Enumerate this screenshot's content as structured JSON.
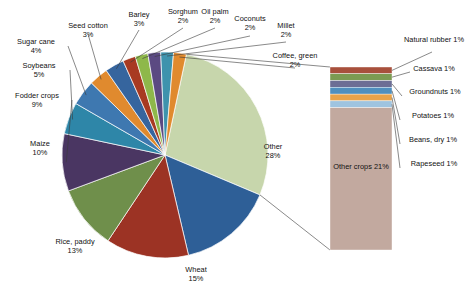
{
  "chart_data": {
    "type": "pie",
    "title": "",
    "subtitle": "",
    "xlabel": "",
    "ylabel": "",
    "legend_position": "none",
    "grid": false,
    "value_suffix": "%",
    "categories": [
      "Other",
      "Wheat",
      "Rice, paddy",
      "Maize",
      "Fodder crops",
      "Soybeans",
      "Sugar cane",
      "Seed cotton",
      "Barley",
      "Sorghum",
      "Oil palm",
      "Coconuts",
      "Millet",
      "Coffee, green"
    ],
    "values": [
      28,
      15,
      13,
      10,
      9,
      5,
      4,
      3,
      3,
      2,
      2,
      2,
      2,
      2
    ],
    "slices": [
      {
        "label": "Other",
        "value": 28,
        "value_text": "28%",
        "color": "#c7d6ac"
      },
      {
        "label": "Wheat",
        "value": 15,
        "value_text": "15%",
        "color": "#2e5f97"
      },
      {
        "label": "Rice, paddy",
        "value": 13,
        "value_text": "13%",
        "color": "#9c3324"
      },
      {
        "label": "Maize",
        "value": 10,
        "value_text": "10%",
        "color": "#6f8f4b"
      },
      {
        "label": "Fodder crops",
        "value": 9,
        "value_text": "9%",
        "color": "#4a3662"
      },
      {
        "label": "Soybeans",
        "value": 5,
        "value_text": "5%",
        "color": "#2e86a8"
      },
      {
        "label": "Sugar cane",
        "value": 4,
        "value_text": "4%",
        "color": "#3e78b0"
      },
      {
        "label": "Seed cotton",
        "value": 3,
        "value_text": "3%",
        "color": "#e08a2e"
      },
      {
        "label": "Barley",
        "value": 3,
        "value_text": "3%",
        "color": "#36659e"
      },
      {
        "label": "Sorghum",
        "value": 2,
        "value_text": "2%",
        "color": "#a83a22"
      },
      {
        "label": "Oil palm",
        "value": 2,
        "value_text": "2%",
        "color": "#8eb84a"
      },
      {
        "label": "Coconuts",
        "value": 2,
        "value_text": "2%",
        "color": "#5b4a82"
      },
      {
        "label": "Millet",
        "value": 2,
        "value_text": "2%",
        "color": "#3e93ad"
      },
      {
        "label": "Coffee, green",
        "value": 2,
        "value_text": "2%",
        "color": "#e08a2e"
      }
    ],
    "breakout": {
      "source_slice": "Other",
      "source_value": 28,
      "type": "stacked_bar",
      "segments": [
        {
          "label": "Natural rubber",
          "value": 1,
          "value_text": "1%",
          "color": "#a8503c"
        },
        {
          "label": "Cassava",
          "value": 1,
          "value_text": "1%",
          "color": "#7c9b52"
        },
        {
          "label": "Groundnuts",
          "value": 1,
          "value_text": "1%",
          "color": "#6c6e95"
        },
        {
          "label": "Potatoes",
          "value": 1,
          "value_text": "1%",
          "color": "#4f8fbe"
        },
        {
          "label": "Beans, dry",
          "value": 1,
          "value_text": "1%",
          "color": "#e8a34a"
        },
        {
          "label": "Rapeseed",
          "value": 1,
          "value_text": "1%",
          "color": "#9fc4e0"
        },
        {
          "label": "Other crops",
          "value": 21,
          "value_text": "21%",
          "color": "#c2a99f"
        }
      ]
    }
  },
  "labels": {
    "seed_cotton": {
      "name": "Seed cotton",
      "pct": "3%"
    },
    "sugar_cane": {
      "name": "Sugar cane",
      "pct": "4%"
    },
    "soybeans": {
      "name": "Soybeans",
      "pct": "5%"
    },
    "fodder_crops": {
      "name": "Fodder crops",
      "pct": "9%"
    },
    "maize": {
      "name": "Maize",
      "pct": "10%"
    },
    "rice_paddy": {
      "name": "Rice, paddy",
      "pct": "13%"
    },
    "wheat": {
      "name": "Wheat",
      "pct": "15%"
    },
    "barley": {
      "name": "Barley",
      "pct": "3%"
    },
    "sorghum": {
      "name": "Sorghum",
      "pct": "2%"
    },
    "oil_palm": {
      "name": "Oil palm",
      "pct": "2%"
    },
    "coconuts": {
      "name": "Coconuts",
      "pct": "2%"
    },
    "millet": {
      "name": "Millet",
      "pct": "2%"
    },
    "coffee_green": {
      "name": "Coffee, green",
      "pct": "2%"
    },
    "other": {
      "name": "Other",
      "pct": "28%"
    },
    "natural_rubber": {
      "name": "Natural rubber",
      "pct": "1%"
    },
    "cassava": {
      "name": "Cassava",
      "pct": "1%"
    },
    "groundnuts": {
      "name": "Groundnuts",
      "pct": "1%"
    },
    "potatoes": {
      "name": "Potatoes",
      "pct": "1%"
    },
    "beans_dry": {
      "name": "Beans, dry",
      "pct": "1%"
    },
    "rapeseed": {
      "name": "Rapeseed",
      "pct": "1%"
    },
    "other_crops": {
      "name": "Other crops",
      "pct": "21%"
    }
  }
}
